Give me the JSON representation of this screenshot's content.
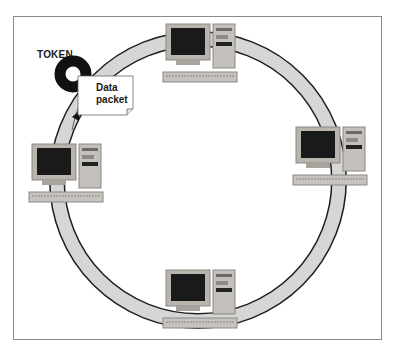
{
  "diagram": {
    "type": "token-ring-network",
    "token_label": "TOKEN",
    "packet_label_line1": "Data",
    "packet_label_line2": "packet",
    "nodes": [
      {
        "id": "computer-top",
        "position": "top"
      },
      {
        "id": "computer-right",
        "position": "right"
      },
      {
        "id": "computer-bottom",
        "position": "bottom"
      },
      {
        "id": "computer-left",
        "position": "left"
      }
    ],
    "colors": {
      "ring_fill": "#d6d6d6",
      "ring_edge": "#1e1e1e",
      "token": "#111111",
      "monitor_case": "#b9b4ae",
      "screen": "#1a1a1a",
      "frame_border": "#8a8a8a"
    }
  }
}
